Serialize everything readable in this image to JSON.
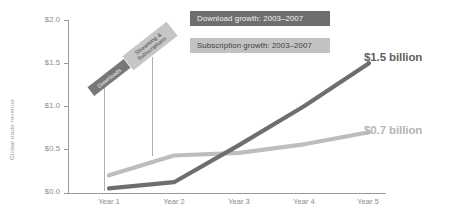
{
  "chart_data": {
    "type": "line",
    "title": "",
    "xlabel": "",
    "ylabel": "Global trade revenue",
    "ylim": [
      0.0,
      2.0
    ],
    "grid": false,
    "legend_position": "top-right",
    "categories": [
      "Year 1",
      "Year 2",
      "Year 3",
      "Year 4",
      "Year 5"
    ],
    "y_tick_labels": [
      "$2.0",
      "$1.5",
      "$1.0",
      "$0.5",
      "$0.0"
    ],
    "y_tick_values": [
      2.0,
      1.5,
      1.0,
      0.5,
      0.0
    ],
    "series": [
      {
        "name": "Download growth: 2003–2007",
        "short_name": "Downloads",
        "color": "#6e6e6e",
        "values": [
          0.05,
          0.12,
          0.55,
          1.0,
          1.5
        ],
        "end_label": "$1.5 billion"
      },
      {
        "name": "Subscription growth: 2003–2007",
        "short_name": "Streaming & Subscriptions",
        "color": "#bdbdbd",
        "values": [
          0.2,
          0.43,
          0.46,
          0.56,
          0.7
        ],
        "end_label": "$0.7 billion"
      }
    ]
  },
  "legend": {
    "items": [
      {
        "label": "Download growth: 2003–2007"
      },
      {
        "label": "Subscription growth: 2003–2007"
      }
    ]
  },
  "callouts": [
    {
      "label": "Downloads"
    },
    {
      "label": "Streaming &\nSubscriptions"
    }
  ],
  "annotations": [
    {
      "label": "$1.5 billion"
    },
    {
      "label": "$0.7 billion"
    }
  ],
  "axes": {
    "y_title": "Global trade revenue"
  }
}
